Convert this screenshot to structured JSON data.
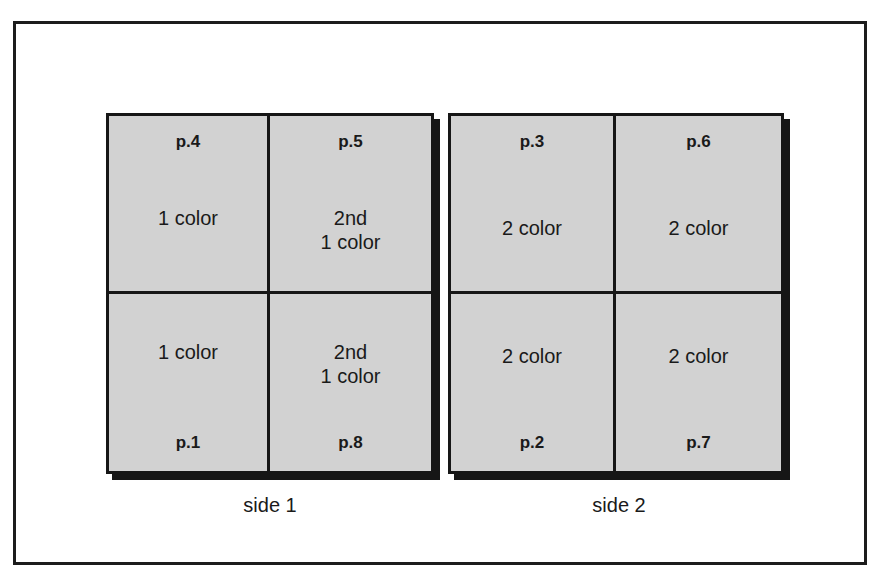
{
  "diagram": {
    "sides": [
      {
        "label": "side 1",
        "cells": [
          {
            "page": "p.4",
            "text": "1 color",
            "position": "top-left"
          },
          {
            "page": "p.5",
            "text": "2nd\n1 color",
            "position": "top-right"
          },
          {
            "page": "p.1",
            "text": "1 color",
            "position": "bottom-left"
          },
          {
            "page": "p.8",
            "text": "2nd\n1 color",
            "position": "bottom-right"
          }
        ]
      },
      {
        "label": "side 2",
        "cells": [
          {
            "page": "p.3",
            "text": "2 color",
            "position": "top-left"
          },
          {
            "page": "p.6",
            "text": "2 color",
            "position": "top-right"
          },
          {
            "page": "p.2",
            "text": "2 color",
            "position": "bottom-left"
          },
          {
            "page": "p.7",
            "text": "2 color",
            "position": "bottom-right"
          }
        ]
      }
    ],
    "colors": {
      "sheet_fill": "#d2d2d2",
      "line": "#161616",
      "background": "#ffffff"
    }
  }
}
